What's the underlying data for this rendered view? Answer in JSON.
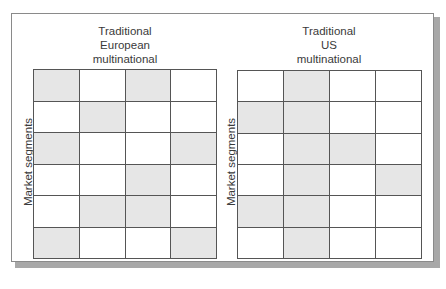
{
  "diagram": {
    "shade_color": "#e6e6e6",
    "line_color": "#555555",
    "panels": [
      {
        "id": "european",
        "title_lines": [
          "Traditional",
          "European",
          "multinational"
        ],
        "y_axis_label": "Market segments",
        "rows": 6,
        "cols": 4,
        "shaded": [
          [
            1,
            0,
            1,
            0
          ],
          [
            0,
            1,
            0,
            0
          ],
          [
            1,
            0,
            0,
            1
          ],
          [
            0,
            0,
            1,
            0
          ],
          [
            0,
            1,
            1,
            0
          ],
          [
            1,
            0,
            0,
            1
          ]
        ]
      },
      {
        "id": "us",
        "title_lines": [
          "Traditional",
          "US",
          "multinational"
        ],
        "y_axis_label": "Market segments",
        "rows": 6,
        "cols": 4,
        "shaded": [
          [
            0,
            1,
            0,
            0
          ],
          [
            1,
            1,
            0,
            0
          ],
          [
            0,
            1,
            1,
            0
          ],
          [
            0,
            1,
            0,
            1
          ],
          [
            1,
            1,
            0,
            0
          ],
          [
            0,
            1,
            0,
            0
          ]
        ]
      }
    ]
  }
}
